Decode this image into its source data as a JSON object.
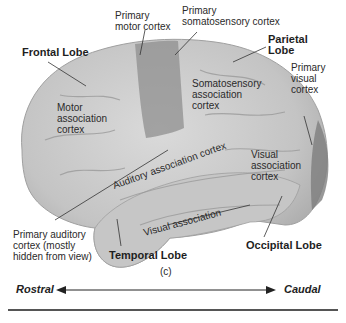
{
  "figure": {
    "panel_label": "(c)",
    "labels": {
      "primary_motor_cortex": [
        "Primary",
        "motor cortex"
      ],
      "primary_somatosensory_cortex": [
        "Primary",
        "somatosensory cortex"
      ],
      "frontal_lobe": "Frontal Lobe",
      "parietal_lobe": [
        "Parietal",
        "Lobe"
      ],
      "primary_visual_cortex": [
        "Primary",
        "visual",
        "cortex"
      ],
      "motor_association_cortex": [
        "Motor",
        "association",
        "cortex"
      ],
      "somatosensory_association_cortex": [
        "Somatosensory",
        "association",
        "cortex"
      ],
      "auditory_association_cortex": "Auditory association cortex",
      "visual_association_cortex": [
        "Visual",
        "association",
        "cortex"
      ],
      "visual_association": "Visual association",
      "primary_auditory_cortex": [
        "Primary auditory",
        "cortex (mostly",
        "hidden from view)"
      ],
      "temporal_lobe": "Temporal Lobe",
      "occipital_lobe": "Occipital Lobe"
    },
    "axis": {
      "left": "Rostral",
      "right": "Caudal"
    },
    "colors": {
      "brain_light": "#cfcfcf",
      "brain_mid": "#b8b8b8",
      "motor_strip": "#8f8f8f",
      "visual_pole": "#7e7e7e"
    }
  }
}
